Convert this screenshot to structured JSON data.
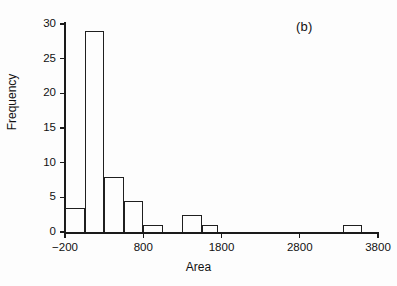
{
  "panel": {
    "letter": "(b)"
  },
  "chart_data": {
    "type": "bar",
    "title": "",
    "subtitle": "",
    "xlabel": "Area",
    "ylabel": "Frequency",
    "xlim": [
      -200,
      3800
    ],
    "ylim": [
      0,
      30
    ],
    "grid": false,
    "legend": null,
    "bin_width": 250,
    "xticks": [
      -200,
      800,
      1800,
      2800,
      3800
    ],
    "xticklabels": [
      "-200",
      "800",
      "1800",
      "2800",
      "3800"
    ],
    "yticks": [
      0,
      5,
      10,
      15,
      20,
      25,
      30
    ],
    "yticklabels": [
      "0",
      "5",
      "10",
      "15",
      "20",
      "25",
      "30"
    ],
    "bins": [
      {
        "start": -200,
        "end": 50,
        "value": 3.5
      },
      {
        "start": 50,
        "end": 300,
        "value": 29
      },
      {
        "start": 300,
        "end": 550,
        "value": 8
      },
      {
        "start": 550,
        "end": 800,
        "value": 4.5
      },
      {
        "start": 800,
        "end": 1050,
        "value": 1
      },
      {
        "start": 1050,
        "end": 1300,
        "value": 0
      },
      {
        "start": 1300,
        "end": 1550,
        "value": 2.5
      },
      {
        "start": 1550,
        "end": 1750,
        "value": 1
      },
      {
        "start": 3350,
        "end": 3600,
        "value": 1
      }
    ],
    "categories": [
      "-200",
      "50",
      "300",
      "550",
      "800",
      "1050",
      "1300",
      "1550",
      "3350"
    ],
    "values": [
      3.5,
      29,
      8,
      4.5,
      1,
      0,
      2.5,
      1,
      1
    ]
  },
  "colors": {
    "bar_outline": "#1f1f1f",
    "axis": "#1a1a1a",
    "background": "#fdfdfd",
    "text": "#111111"
  }
}
